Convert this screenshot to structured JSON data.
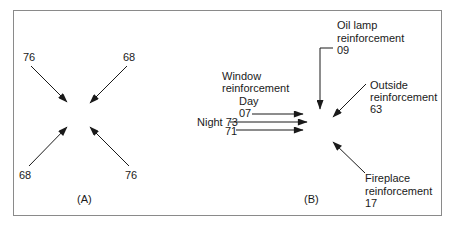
{
  "figure": {
    "panel_a": {
      "caption": "(A)",
      "arrows": [
        {
          "position": "top-left",
          "value": "76"
        },
        {
          "position": "top-right",
          "value": "68"
        },
        {
          "position": "bottom-left",
          "value": "68"
        },
        {
          "position": "bottom-right",
          "value": "76"
        }
      ]
    },
    "panel_b": {
      "caption": "(B)",
      "oil_lamp": {
        "line1": "Oil lamp",
        "line2": "reinforcement",
        "value": "09"
      },
      "outside": {
        "line1": "Outside",
        "line2": "reinforcement",
        "value": "63"
      },
      "fireplace": {
        "line1": "Fireplace",
        "line2": "reinforcement",
        "value": "17"
      },
      "window": {
        "line1": "Window",
        "line2": "reinforcement",
        "day_label": "Day",
        "day_value": "07",
        "night_label": "Night 73",
        "third_value": "71"
      }
    },
    "colors": {
      "ink": "#1a1a1a",
      "border": "#8a8a8a",
      "background": "#ffffff"
    }
  }
}
